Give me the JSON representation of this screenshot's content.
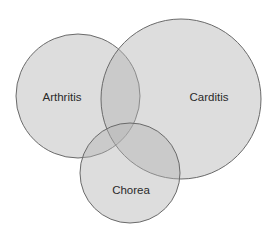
{
  "diagram": {
    "type": "venn",
    "sets": [
      {
        "id": "arthritis",
        "label": "Arthritis",
        "cx": 78,
        "cy": 96,
        "r": 62,
        "label_x": 62,
        "label_y": 101
      },
      {
        "id": "carditis",
        "label": "Carditis",
        "cx": 181,
        "cy": 99,
        "r": 80,
        "label_x": 209,
        "label_y": 101
      },
      {
        "id": "chorea",
        "label": "Chorea",
        "cx": 130,
        "cy": 173,
        "r": 50,
        "label_x": 131,
        "label_y": 194
      }
    ],
    "colors": {
      "fill": "#b4b4b4",
      "fill_opacity": 0.45,
      "stroke": "#6a6a6a",
      "background": "#ffffff"
    }
  }
}
